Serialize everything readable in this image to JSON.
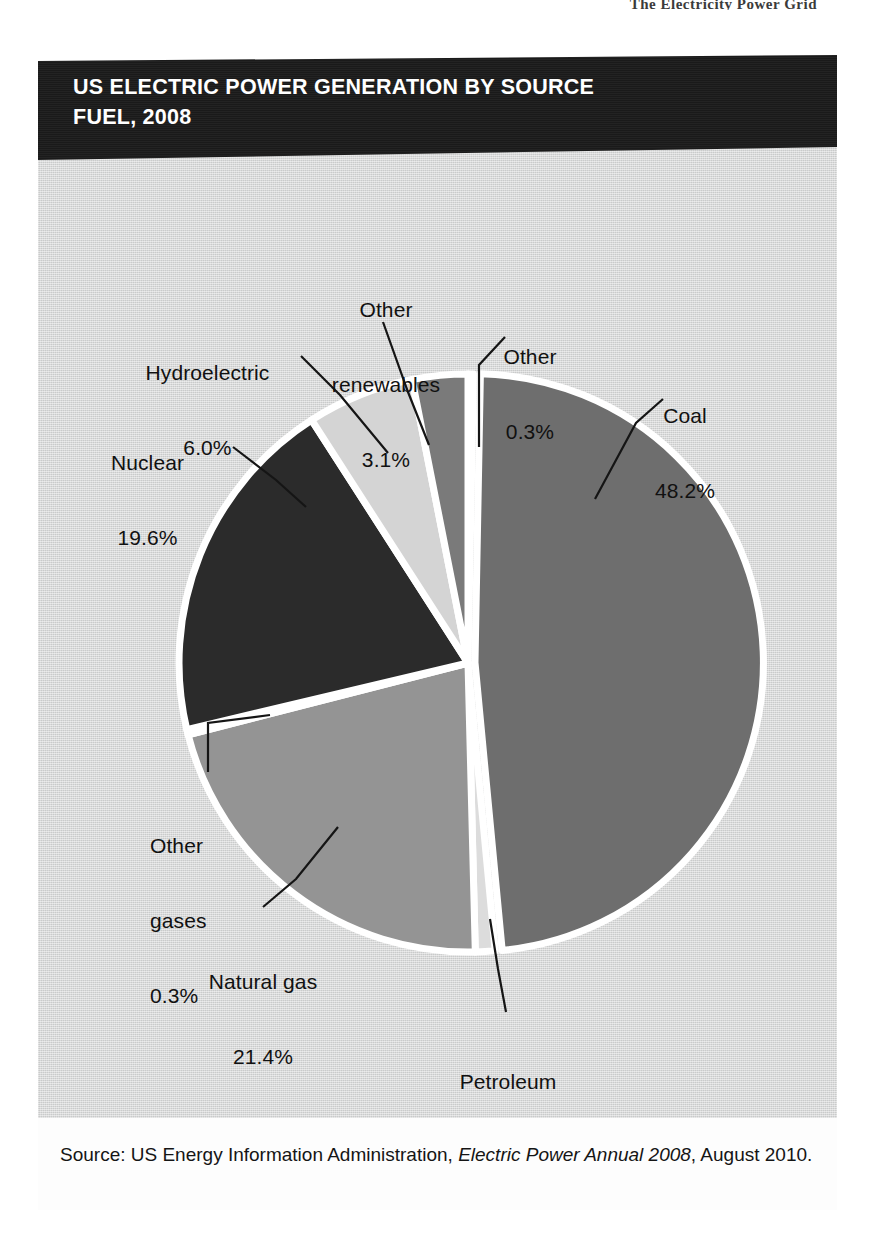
{
  "running_head": "The Electricity Power Grid",
  "figure": {
    "title_line_1": "US ELECTRIC POWER GENERATION BY SOURCE",
    "title_line_2": "FUEL, 2008",
    "source_prefix": "Source: US Energy Information Administration, ",
    "source_italic": "Electric Power Annual 2008",
    "source_suffix": ", August 2010."
  },
  "chart_data": {
    "type": "pie",
    "title": "US ELECTRIC POWER GENERATION BY SOURCE FUEL, 2008",
    "unit": "%",
    "start_angle_deg": 0,
    "direction": "clockwise",
    "legend": "none (direct labels with leader lines)",
    "categories": [
      "Other",
      "Coal",
      "Petroleum",
      "Natural gas",
      "Other gases",
      "Nuclear",
      "Hydroelectric",
      "Other renewables"
    ],
    "values": [
      0.3,
      48.2,
      1.1,
      21.4,
      0.3,
      19.6,
      6.0,
      3.1
    ],
    "slices": [
      {
        "label": "Other",
        "value": 0.3,
        "value_text": "0.3%",
        "color": "#161616"
      },
      {
        "label": "Coal",
        "value": 48.2,
        "value_text": "48.2%",
        "color": "#6e6e6e"
      },
      {
        "label": "Petroleum",
        "value": 1.1,
        "value_text": "1.1%",
        "color": "#dcdcdc"
      },
      {
        "label": "Natural gas",
        "value": 21.4,
        "value_text": "21.4%",
        "color": "#949494"
      },
      {
        "label": "Other gases",
        "value": 0.3,
        "value_text": "0.3%",
        "color": "#e3e3e3"
      },
      {
        "label": "Nuclear",
        "value": 19.6,
        "value_text": "19.6%",
        "color": "#2b2b2b"
      },
      {
        "label": "Hydroelectric",
        "value": 6.0,
        "value_text": "6.0%",
        "color": "#d4d4d4"
      },
      {
        "label": "Other renewables",
        "value": 3.1,
        "value_text": "3.1%",
        "color": "#7a7a7a"
      }
    ]
  },
  "labels": {
    "other_renewables": {
      "l1": "Other",
      "l2": "renewables",
      "l3": "3.1%"
    },
    "other": {
      "l1": "Other",
      "l2": "0.3%"
    },
    "coal": {
      "l1": "Coal",
      "l2": "48.2%"
    },
    "hydroelectric": {
      "l1": "Hydroelectric",
      "l2": "6.0%"
    },
    "nuclear": {
      "l1": "Nuclear",
      "l2": "19.6%"
    },
    "other_gases": {
      "l1": "Other",
      "l2": "gases",
      "l3": "0.3%"
    },
    "natural_gas": {
      "l1": "Natural gas",
      "l2": "21.4%"
    },
    "petroleum": {
      "l1": "Petroleum",
      "l2": "1.1%"
    }
  },
  "colors": {
    "card_background": "#d2d3d3",
    "banner": "#1b1b1b",
    "banner_text": "#ffffff",
    "source_band": "#fdfdfd",
    "label_text": "#111111",
    "slice_gap": "#ffffff"
  }
}
